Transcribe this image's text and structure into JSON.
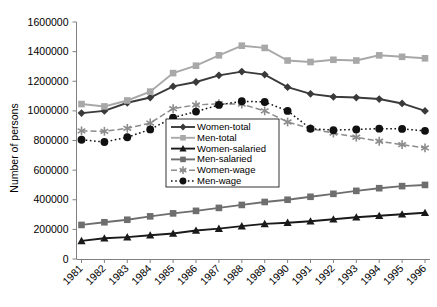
{
  "chart_data": {
    "type": "line",
    "title": "",
    "xlabel": "",
    "ylabel": "Number of persons",
    "x": [
      1981,
      1982,
      1983,
      1984,
      1985,
      1986,
      1987,
      1988,
      1989,
      1990,
      1991,
      1992,
      1993,
      1994,
      1995,
      1996
    ],
    "categories": [
      "1981",
      "1982",
      "1983",
      "1984",
      "1985",
      "1986",
      "1987",
      "1988",
      "1989",
      "1990",
      "1991",
      "1992",
      "1993",
      "1994",
      "1995",
      "1996"
    ],
    "ylim": [
      0,
      1600000
    ],
    "yticks": [
      0,
      200000,
      400000,
      600000,
      800000,
      1000000,
      1200000,
      1400000,
      1600000
    ],
    "ytick_labels": [
      "0",
      "200000",
      "400000",
      "600000",
      "800000",
      "1000000",
      "1200000",
      "1400000",
      "1600000"
    ],
    "grid": false,
    "legend_position": "center-right-inside",
    "series": [
      {
        "name": "Women-total",
        "color": "#3a3a3a",
        "marker": "diamond",
        "dash": "solid",
        "values": [
          985000,
          1000000,
          1055000,
          1090000,
          1165000,
          1195000,
          1240000,
          1265000,
          1245000,
          1160000,
          1115000,
          1095000,
          1090000,
          1080000,
          1050000,
          1000000
        ]
      },
      {
        "name": "Men-total",
        "color": "#a8a8a8",
        "marker": "square",
        "dash": "solid",
        "values": [
          1046000,
          1030000,
          1070000,
          1130000,
          1255000,
          1305000,
          1375000,
          1440000,
          1425000,
          1340000,
          1330000,
          1345000,
          1340000,
          1375000,
          1365000,
          1355000
        ]
      },
      {
        "name": "Women-salaried",
        "color": "#1a1a1a",
        "marker": "triangle",
        "dash": "solid",
        "values": [
          122000,
          140000,
          148000,
          160000,
          172000,
          192000,
          205000,
          222000,
          237000,
          245000,
          255000,
          268000,
          282000,
          292000,
          302000,
          312000
        ]
      },
      {
        "name": "Men-salaried",
        "color": "#6e6e6e",
        "marker": "square",
        "dash": "solid",
        "values": [
          230000,
          248000,
          265000,
          288000,
          308000,
          325000,
          345000,
          365000,
          385000,
          400000,
          420000,
          440000,
          460000,
          478000,
          492000,
          500000
        ]
      },
      {
        "name": "Women-wage",
        "color": "#8c8c8c",
        "marker": "asterisk",
        "dash": "dashed",
        "values": [
          865000,
          862000,
          882000,
          918000,
          1015000,
          1040000,
          1048000,
          1045000,
          1000000,
          925000,
          880000,
          850000,
          822000,
          795000,
          772000,
          750000
        ]
      },
      {
        "name": "Men-wage",
        "color": "#111111",
        "marker": "circle",
        "dash": "dotted",
        "values": [
          805000,
          790000,
          822000,
          875000,
          955000,
          995000,
          1040000,
          1065000,
          1060000,
          1000000,
          880000,
          870000,
          875000,
          880000,
          878000,
          865000
        ]
      }
    ]
  },
  "legend": {
    "entries": [
      {
        "label": "Women-total"
      },
      {
        "label": "Men-total"
      },
      {
        "label": "Women-salaried"
      },
      {
        "label": "Men-salaried"
      },
      {
        "label": "Women-wage"
      },
      {
        "label": "Men-wage"
      }
    ]
  }
}
